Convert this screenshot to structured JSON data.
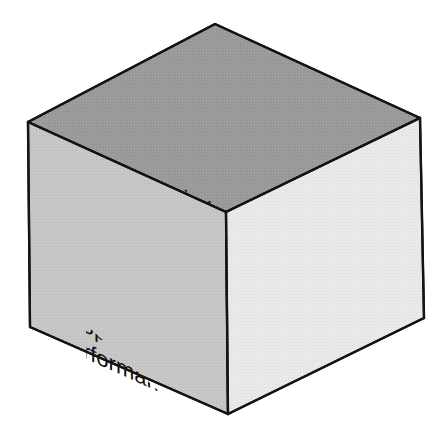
{
  "figure": {
    "name": "information-quality-cube",
    "type": "isometric-cube-diagram",
    "background_color": "#ffffff"
  },
  "colors": {
    "top_face": "#9a9a9a",
    "left_face": "#c6c6c6",
    "right_face": "#e9e9e9",
    "edge": "#141414",
    "text": "#111111"
  },
  "faces": {
    "top": {
      "id": "time-face",
      "heading": "Time",
      "items": [
        "Timeliness",
        "Currency",
        "Frequency",
        "Time Period"
      ]
    },
    "left": {
      "id": "content-face",
      "heading": "Content",
      "items": [
        "Accuracy",
        "Relevance",
        "Completeness",
        "Conciseness",
        "Scope",
        "Performance"
      ]
    },
    "right": {
      "id": "form-face",
      "heading": "Form",
      "items": [
        "Clarity",
        "Detail",
        "Order",
        "Presentation",
        "Media"
      ]
    }
  },
  "geometry": {
    "top_left": "28,122",
    "top_apex": "215,24",
    "top_right": "420,118",
    "center_front": "226,212",
    "bottom_left": "30,327",
    "bottom_center": "228,414",
    "bottom_right": "424,318"
  }
}
